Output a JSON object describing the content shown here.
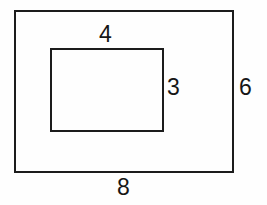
{
  "diagram": {
    "type": "nested-rectangles",
    "background_color": "#fefefe",
    "stroke_color": "#1c1c1c",
    "text_color": "#161616",
    "outer_rectangle": {
      "name": "outer rectangle",
      "width_label": "8",
      "height_label": "6"
    },
    "inner_rectangle": {
      "name": "inner rectangle",
      "width_label": "4",
      "height_label": "3"
    },
    "labels": {
      "inner_width": "4",
      "inner_height": "3",
      "outer_height": "6",
      "outer_width": "8"
    }
  }
}
